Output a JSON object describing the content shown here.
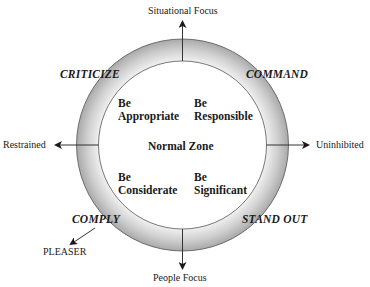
{
  "diagram": {
    "axes": {
      "top": "Situational Focus",
      "bottom": "People Focus",
      "left": "Restrained",
      "right": "Uninhibited"
    },
    "outer_styles": {
      "top_left": "CRITICIZE",
      "top_right": "COMMAND",
      "bottom_left": "COMPLY",
      "bottom_right": "STAND OUT"
    },
    "extreme": "PLEASER",
    "center": "Normal Zone",
    "quadrants": {
      "top_left": {
        "line1": "Be",
        "line2": "Appropriate"
      },
      "top_right": {
        "line1": "Be",
        "line2": "Responsible"
      },
      "bottom_left": {
        "line1": "Be",
        "line2": "Considerate"
      },
      "bottom_right": {
        "line1": "Be",
        "line2": "Significant"
      }
    },
    "colors": {
      "ring_light": "#f2f2f2",
      "ring_dark": "#a8a8a8",
      "line": "#333333"
    }
  }
}
